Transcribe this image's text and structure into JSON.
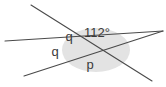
{
  "figure": {
    "background_color": "#ffffff",
    "line_color": "#4a4a4a",
    "shading_color": "#e2e2e2",
    "label_color": "#3a3a3a",
    "intersection": {
      "x": 94,
      "y": 50
    },
    "shaded_ellipse": {
      "cx": 96,
      "cy": 50,
      "rx": 34,
      "ry": 22,
      "fill": "#e3e3e3"
    },
    "lines": [
      {
        "name": "line-upper-left-to-lower-right",
        "x1": 31,
        "y1": 5,
        "x2": 152,
        "y2": 81
      },
      {
        "name": "line-left-horizontal-to-upper-right",
        "x1": 5,
        "y1": 41,
        "x2": 163,
        "y2": 31
      },
      {
        "name": "line-lower-left-to-upper-right",
        "x1": 24,
        "y1": 76,
        "x2": 163,
        "y2": 31
      }
    ],
    "labels": [
      {
        "name": "angle-label-q-upper",
        "text": "q",
        "x": 69,
        "y": 41,
        "size": 13
      },
      {
        "name": "angle-label-112-degrees",
        "text": "112°",
        "x": 84,
        "y": 37,
        "size": 13
      },
      {
        "name": "angle-label-q-lower",
        "text": "q",
        "x": 55,
        "y": 56,
        "size": 13
      },
      {
        "name": "angle-label-p",
        "text": "p",
        "x": 90,
        "y": 69,
        "size": 13
      }
    ]
  }
}
